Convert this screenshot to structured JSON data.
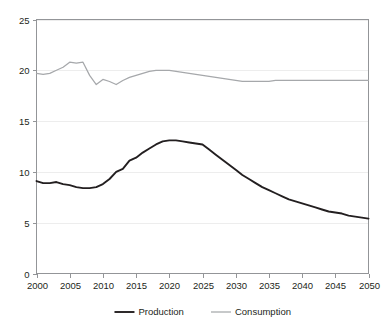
{
  "chart_data": {
    "type": "line",
    "title": "",
    "subtitle": "",
    "xlabel": "",
    "ylabel": "",
    "xlim": [
      2000,
      2050
    ],
    "ylim": [
      0,
      25
    ],
    "grid": true,
    "legend_position": "bottom",
    "x_ticks": [
      2000,
      2005,
      2010,
      2015,
      2020,
      2025,
      2030,
      2035,
      2040,
      2045,
      2050
    ],
    "x_tick_labels": [
      "2000",
      "2005",
      "2010",
      "2015",
      "2020",
      "2025",
      "2030",
      "2035",
      "2040",
      "2045",
      "2050"
    ],
    "y_ticks": [
      0,
      5,
      10,
      15,
      20,
      25
    ],
    "y_tick_labels": [
      "0",
      "5",
      "10",
      "15",
      "20",
      "25"
    ],
    "x": [
      2000,
      2001,
      2002,
      2003,
      2004,
      2005,
      2006,
      2007,
      2008,
      2009,
      2010,
      2011,
      2012,
      2013,
      2014,
      2015,
      2016,
      2017,
      2018,
      2019,
      2020,
      2021,
      2022,
      2023,
      2024,
      2025,
      2026,
      2027,
      2028,
      2029,
      2030,
      2031,
      2032,
      2033,
      2034,
      2035,
      2036,
      2037,
      2038,
      2039,
      2040,
      2041,
      2042,
      2043,
      2044,
      2045,
      2046,
      2047,
      2048,
      2049,
      2050
    ],
    "series": [
      {
        "name": "Production",
        "color": "#231f20",
        "values": [
          9.1,
          8.9,
          8.9,
          9.0,
          8.8,
          8.7,
          8.5,
          8.4,
          8.4,
          8.5,
          8.8,
          9.3,
          10.0,
          10.3,
          11.1,
          11.4,
          11.9,
          12.3,
          12.7,
          13.0,
          13.1,
          13.1,
          13.0,
          12.9,
          12.8,
          12.7,
          12.2,
          11.7,
          11.2,
          10.7,
          10.2,
          9.7,
          9.3,
          8.9,
          8.5,
          8.2,
          7.9,
          7.6,
          7.3,
          7.1,
          6.9,
          6.7,
          6.5,
          6.3,
          6.1,
          6.0,
          5.9,
          5.7,
          5.6,
          5.5,
          5.4
        ]
      },
      {
        "name": "Consumption",
        "color": "#a6a8ab",
        "values": [
          19.7,
          19.6,
          19.7,
          20.0,
          20.3,
          20.8,
          20.7,
          20.8,
          19.5,
          18.6,
          19.1,
          18.9,
          18.6,
          19.0,
          19.3,
          19.5,
          19.7,
          19.9,
          20.0,
          20.0,
          20.0,
          19.9,
          19.8,
          19.7,
          19.6,
          19.5,
          19.4,
          19.3,
          19.2,
          19.1,
          19.0,
          18.9,
          18.9,
          18.9,
          18.9,
          18.9,
          19.0,
          19.0,
          19.0,
          19.0,
          19.0,
          19.0,
          19.0,
          19.0,
          19.0,
          19.0,
          19.0,
          19.0,
          19.0,
          19.0,
          19.0
        ]
      }
    ],
    "legend": [
      {
        "label": "Production",
        "color": "#231f20"
      },
      {
        "label": "Consumption",
        "color": "#a6a8ab"
      }
    ]
  },
  "colors": {
    "production": "#231f20",
    "consumption": "#a6a8ab",
    "frame": "#939598",
    "gridline": "#ededed",
    "background": "#ffffff",
    "text": "#231f20"
  }
}
